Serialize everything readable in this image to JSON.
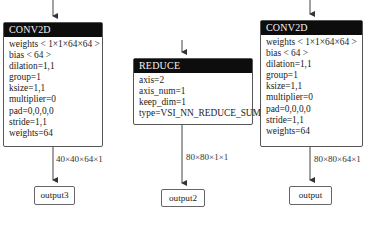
{
  "nodes": [
    {
      "id": "conv2d_left",
      "title": "CONV2D",
      "rows": [
        "weights < 1×1×64×64 >",
        "bias < 64 >",
        "dilation=1,1",
        "group=1",
        "ksize=1,1",
        "multiplier=0",
        "pad=0,0,0,0",
        "stride=1,1",
        "weights=64"
      ]
    },
    {
      "id": "reduce",
      "title": "REDUCE",
      "rows": [
        "axis=2",
        "axis_num=1",
        "keep_dim=1",
        "type=VSI_NN_REDUCE_SUM"
      ]
    },
    {
      "id": "conv2d_right",
      "title": "CONV2D",
      "rows": [
        "weights < 1×1×64×64 >",
        "bias < 64 >",
        "dilation=1,1",
        "group=1",
        "ksize=1,1",
        "multiplier=0",
        "pad=0,0,0,0",
        "stride=1,1",
        "weights=64"
      ]
    }
  ],
  "edges": [
    {
      "from": "conv2d_left",
      "to": "output3",
      "label": "40×40×64×1"
    },
    {
      "from": "reduce",
      "to": "output2",
      "label": "80×80×1×1"
    },
    {
      "from": "conv2d_right",
      "to": "output",
      "label": "80×80×64×1"
    }
  ],
  "outputs": [
    {
      "id": "output3",
      "label": "output3"
    },
    {
      "id": "output2",
      "label": "output2"
    },
    {
      "id": "output",
      "label": "output"
    }
  ],
  "colors": {
    "header_bg": "#0d0d0d",
    "header_text": "#f2f2f2",
    "border": "#555555",
    "edge": "#444444"
  }
}
